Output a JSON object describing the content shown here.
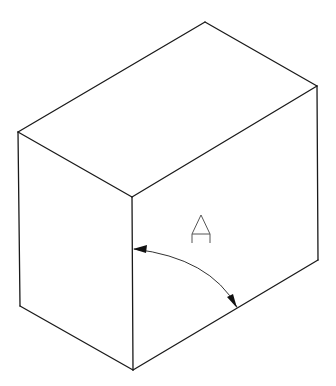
{
  "diagram": {
    "type": "isometric-box",
    "vertices": {
      "top": [
        205,
        22
      ],
      "left_top": [
        18,
        132
      ],
      "right_top": [
        317,
        86
      ],
      "front_top": [
        132,
        197
      ],
      "left_bottom": [
        20,
        306
      ],
      "right_bottom": [
        318,
        260
      ],
      "front_bottom": [
        133,
        370
      ]
    },
    "angle_annotation": {
      "label": "A",
      "arc_start": [
        133,
        249
      ],
      "arc_end": [
        237,
        308
      ]
    },
    "colors": {
      "line": "#1a1a1a",
      "background": "#ffffff"
    }
  }
}
